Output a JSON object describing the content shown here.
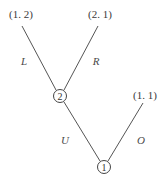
{
  "diagram": {
    "type": "game-tree",
    "nodes": [
      {
        "id": "node-1",
        "label": "1",
        "player": 1,
        "cx": 104,
        "cy": 167,
        "r": 6.5
      },
      {
        "id": "node-2",
        "label": "2",
        "player": 2,
        "cx": 60,
        "cy": 96,
        "r": 6.5
      }
    ],
    "terminals": [
      {
        "id": "payoff-1-2",
        "label": "(1. 2)",
        "x": 21,
        "y": 18
      },
      {
        "id": "payoff-2-1",
        "label": "(2. 1)",
        "x": 100,
        "y": 18
      },
      {
        "id": "payoff-1-1",
        "label": "(1. 1)",
        "x": 145,
        "y": 99
      }
    ],
    "edges": [
      {
        "id": "edge-L",
        "label": "L",
        "from": "node-2",
        "to": "payoff-1-2",
        "x1": 56,
        "y1": 90,
        "x2": 22,
        "y2": 26,
        "lx": 24,
        "ly": 65
      },
      {
        "id": "edge-R",
        "label": "R",
        "from": "node-2",
        "to": "payoff-2-1",
        "x1": 64,
        "y1": 90,
        "x2": 98,
        "y2": 26,
        "lx": 96,
        "ly": 65
      },
      {
        "id": "edge-U",
        "label": "U",
        "from": "node-1",
        "to": "node-2",
        "x1": 100,
        "y1": 161,
        "x2": 64,
        "y2": 102,
        "lx": 65,
        "ly": 144
      },
      {
        "id": "edge-O",
        "label": "O",
        "from": "node-1",
        "to": "payoff-1-1",
        "x1": 108,
        "y1": 161,
        "x2": 143,
        "y2": 103,
        "lx": 141,
        "ly": 144
      }
    ]
  },
  "colors": {
    "background": "#ffffff",
    "line": "#555555",
    "text": "#3a3a3a"
  }
}
